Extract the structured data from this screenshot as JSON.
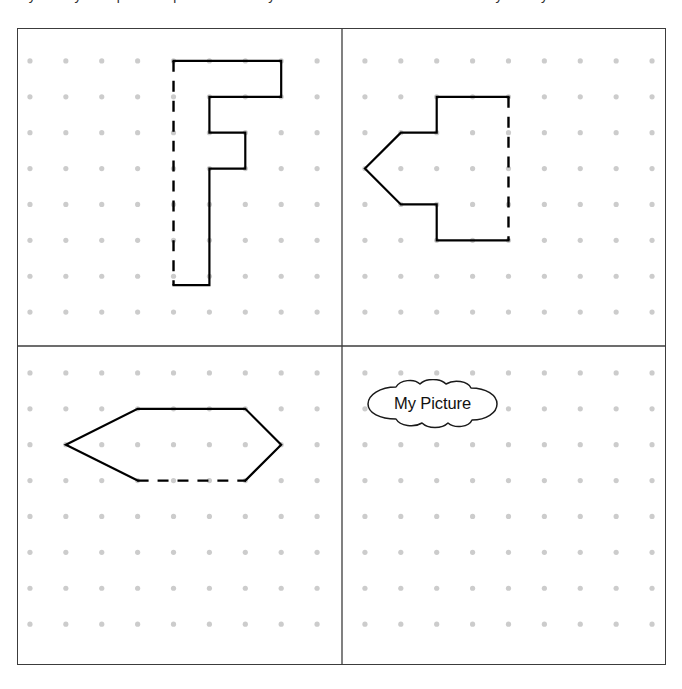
{
  "page": {
    "instruction_partial": "symmetry. Complete the picture so it is symmetrical about the dashed line of symmetry.",
    "background_color": "#ffffff",
    "ink_color": "#000000",
    "dot_color": "#cccccc",
    "frame_color": "#3c3c3c"
  },
  "frame": {
    "x": 17,
    "y": 28,
    "width": 649,
    "height": 637,
    "divider_x": 325,
    "divider_y": 318
  },
  "dot_grid": {
    "spacing": 36,
    "dot_radius": 2.6,
    "color": "#cccccc",
    "top_rows_y": [
      32,
      68,
      104,
      140,
      176,
      212,
      248,
      284
    ],
    "bottom_rows_y": [
      345,
      381,
      417,
      453,
      489,
      525,
      561,
      597
    ],
    "left_cols_x": [
      12,
      48,
      84,
      120,
      156,
      192,
      228,
      264,
      300
    ],
    "right_cols_x": [
      348,
      384,
      420,
      456,
      492,
      528,
      564,
      600,
      636
    ]
  },
  "quadrants": [
    {
      "id": "top-left",
      "name": "quadrant-top-left",
      "shape_name": "f-shape",
      "mirror_line": "left-vertical-dashed",
      "solid_path": "M 156 32 L 264 32 L 264 68 L 192 68 L 192 104 L 228 104 L 228 140 L 192 140 L 192 257 L 156 257",
      "dashed_path": "M 156 32 L 156 257",
      "vertices": [
        [
          156,
          32
        ],
        [
          264,
          32
        ],
        [
          264,
          68
        ],
        [
          192,
          68
        ],
        [
          192,
          104
        ],
        [
          228,
          104
        ],
        [
          228,
          140
        ],
        [
          192,
          140
        ],
        [
          192,
          257
        ],
        [
          156,
          257
        ]
      ]
    },
    {
      "id": "top-right",
      "name": "quadrant-top-right",
      "shape_name": "arrow-shape",
      "mirror_line": "right-vertical-dashed",
      "solid_path": "M 492 68 L 420 68 L 420 104 L 384 104 L 348 140 L 384 176 L 420 176 L 420 212 L 492 212",
      "dashed_path": "M 492 68 L 492 212",
      "vertices": [
        [
          492,
          68
        ],
        [
          420,
          68
        ],
        [
          420,
          104
        ],
        [
          384,
          104
        ],
        [
          348,
          140
        ],
        [
          384,
          176
        ],
        [
          420,
          176
        ],
        [
          420,
          212
        ],
        [
          492,
          212
        ]
      ]
    },
    {
      "id": "bottom-left",
      "name": "quadrant-bottom-left",
      "shape_name": "hexagon-shape",
      "mirror_line": "bottom-horizontal-dashed",
      "solid_path": "M 120 453 L 48 417 L 120 381 L 228 381 L 264 417 L 228 453",
      "dashed_path": "M 120 453 L 228 453",
      "vertices": [
        [
          120,
          453
        ],
        [
          48,
          417
        ],
        [
          120,
          381
        ],
        [
          228,
          381
        ],
        [
          264,
          417
        ],
        [
          228,
          453
        ]
      ]
    },
    {
      "id": "bottom-right",
      "name": "quadrant-bottom-right",
      "shape_name": "empty-answer-area",
      "mirror_line": "",
      "solid_path": "",
      "dashed_path": "",
      "vertices": []
    }
  ],
  "callout": {
    "label": "My Picture",
    "shape": "cloud-bubble",
    "x": 348,
    "y": 350,
    "width": 133,
    "height": 50
  },
  "style": {
    "solid_stroke_width": 2.2,
    "dashed_stroke_width": 2.4,
    "dash_pattern": "11 9",
    "frame_stroke_width": 1.5,
    "divider_stroke_width": 1.3
  }
}
